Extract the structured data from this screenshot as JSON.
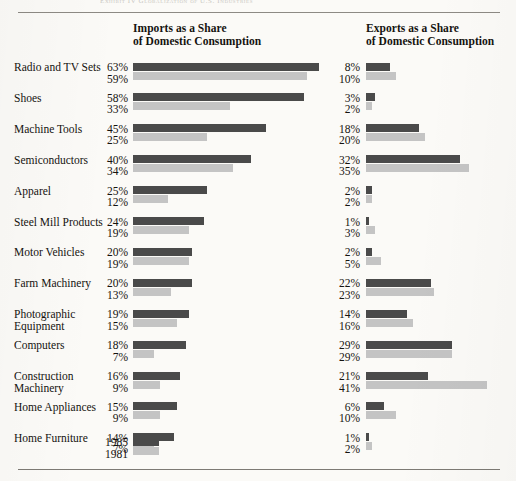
{
  "page": {
    "running_head": "Exhibit IV   Globalization of U.S. Industries",
    "background": "#fbfaf7"
  },
  "headers": {
    "imports_line1": "Imports as a Share",
    "imports_line2": "of Domestic Consumption",
    "exports_line1": "Exports as a Share",
    "exports_line2": "of Domestic Consumption"
  },
  "legend": {
    "year_new": "1985",
    "year_old": "1981",
    "color_new": "#4a4a4a",
    "color_old": "#c4c4c4"
  },
  "chart_data": {
    "type": "bar",
    "title": "Globalization of U.S. Industries",
    "xlabel": "",
    "ylabel": "",
    "xlim": [
      0,
      63
    ],
    "grid": false,
    "legend_position": "bottom-left",
    "orientation": "horizontal",
    "panels": [
      {
        "name": "imports",
        "title": "Imports as a Share of Domestic Consumption"
      },
      {
        "name": "exports",
        "title": "Exports as a Share of Domestic Consumption"
      }
    ],
    "series": [
      {
        "name": "1985",
        "color": "#4a4a4a"
      },
      {
        "name": "1981",
        "color": "#c4c4c4"
      }
    ],
    "categories": [
      "Radio and TV Sets",
      "Shoes",
      "Machine Tools",
      "Semiconductors",
      "Apparel",
      "Steel Mill Products",
      "Motor Vehicles",
      "Farm Machinery",
      "Photographic Equipment",
      "Computers",
      "Construction Machinery",
      "Home Appliances",
      "Home Furniture"
    ],
    "rows": [
      {
        "category_line1": "Radio and TV Sets",
        "category_line2": "",
        "imports_1985": "63%",
        "imports_1981": "59%",
        "exports_1985": "8%",
        "exports_1981": "10%",
        "imports_1985_v": 63,
        "imports_1981_v": 59,
        "exports_1985_v": 8,
        "exports_1981_v": 10
      },
      {
        "category_line1": "Shoes",
        "category_line2": "",
        "imports_1985": "58%",
        "imports_1981": "33%",
        "exports_1985": "3%",
        "exports_1981": "2%",
        "imports_1985_v": 58,
        "imports_1981_v": 33,
        "exports_1985_v": 3,
        "exports_1981_v": 2
      },
      {
        "category_line1": "Machine Tools",
        "category_line2": "",
        "imports_1985": "45%",
        "imports_1981": "25%",
        "exports_1985": "18%",
        "exports_1981": "20%",
        "imports_1985_v": 45,
        "imports_1981_v": 25,
        "exports_1985_v": 18,
        "exports_1981_v": 20
      },
      {
        "category_line1": "Semiconductors",
        "category_line2": "",
        "imports_1985": "40%",
        "imports_1981": "34%",
        "exports_1985": "32%",
        "exports_1981": "35%",
        "imports_1985_v": 40,
        "imports_1981_v": 34,
        "exports_1985_v": 32,
        "exports_1981_v": 35
      },
      {
        "category_line1": "Apparel",
        "category_line2": "",
        "imports_1985": "25%",
        "imports_1981": "12%",
        "exports_1985": "2%",
        "exports_1981": "2%",
        "imports_1985_v": 25,
        "imports_1981_v": 12,
        "exports_1985_v": 2,
        "exports_1981_v": 2
      },
      {
        "category_line1": "Steel Mill Products",
        "category_line2": "",
        "imports_1985": "24%",
        "imports_1981": "19%",
        "exports_1985": "1%",
        "exports_1981": "3%",
        "imports_1985_v": 24,
        "imports_1981_v": 19,
        "exports_1985_v": 1,
        "exports_1981_v": 3
      },
      {
        "category_line1": "Motor Vehicles",
        "category_line2": "",
        "imports_1985": "20%",
        "imports_1981": "19%",
        "exports_1985": "2%",
        "exports_1981": "5%",
        "imports_1985_v": 20,
        "imports_1981_v": 19,
        "exports_1985_v": 2,
        "exports_1981_v": 5
      },
      {
        "category_line1": "Farm Machinery",
        "category_line2": "",
        "imports_1985": "20%",
        "imports_1981": "13%",
        "exports_1985": "22%",
        "exports_1981": "23%",
        "imports_1985_v": 20,
        "imports_1981_v": 13,
        "exports_1985_v": 22,
        "exports_1981_v": 23
      },
      {
        "category_line1": "Photographic",
        "category_line2": "Equipment",
        "imports_1985": "19%",
        "imports_1981": "15%",
        "exports_1985": "14%",
        "exports_1981": "16%",
        "imports_1985_v": 19,
        "imports_1981_v": 15,
        "exports_1985_v": 14,
        "exports_1981_v": 16
      },
      {
        "category_line1": "Computers",
        "category_line2": "",
        "imports_1985": "18%",
        "imports_1981": "7%",
        "exports_1985": "29%",
        "exports_1981": "29%",
        "imports_1985_v": 18,
        "imports_1981_v": 7,
        "exports_1985_v": 29,
        "exports_1981_v": 29
      },
      {
        "category_line1": "Construction",
        "category_line2": "Machinery",
        "imports_1985": "16%",
        "imports_1981": "9%",
        "exports_1985": "21%",
        "exports_1981": "41%",
        "imports_1985_v": 16,
        "imports_1981_v": 9,
        "exports_1985_v": 21,
        "exports_1981_v": 41
      },
      {
        "category_line1": "Home Appliances",
        "category_line2": "",
        "imports_1985": "15%",
        "imports_1981": "9%",
        "exports_1985": "6%",
        "exports_1981": "10%",
        "imports_1985_v": 15,
        "imports_1981_v": 9,
        "exports_1985_v": 6,
        "exports_1981_v": 10
      },
      {
        "category_line1": "Home Furniture",
        "category_line2": "",
        "imports_1985": "14%",
        "imports_1981": "7%",
        "exports_1985": "1%",
        "exports_1981": "2%",
        "imports_1985_v": 14,
        "imports_1981_v": 7,
        "exports_1985_v": 1,
        "exports_1981_v": 2
      }
    ]
  }
}
